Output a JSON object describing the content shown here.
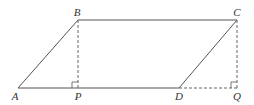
{
  "figure": {
    "type": "parallelogram with perpendiculars",
    "points": {
      "A": {
        "label": "A",
        "x": 18,
        "y": 88,
        "lx": 15,
        "ly": 100
      },
      "B": {
        "label": "B",
        "x": 78,
        "y": 20,
        "lx": 77,
        "ly": 16
      },
      "C": {
        "label": "C",
        "x": 237,
        "y": 20,
        "lx": 237,
        "ly": 16
      },
      "D": {
        "label": "D",
        "x": 179,
        "y": 88,
        "lx": 179,
        "ly": 100
      },
      "P": {
        "label": "P",
        "x": 78,
        "y": 88,
        "lx": 78,
        "ly": 100
      },
      "Q": {
        "label": "Q",
        "x": 237,
        "y": 88,
        "lx": 237,
        "ly": 100
      }
    },
    "solid_segments": [
      [
        "A",
        "B"
      ],
      [
        "B",
        "C"
      ],
      [
        "C",
        "D"
      ],
      [
        "A",
        "D"
      ]
    ],
    "dashed_segments": [
      [
        "B",
        "P"
      ],
      [
        "C",
        "Q"
      ],
      [
        "D",
        "Q"
      ]
    ],
    "right_angles": [
      "P",
      "Q"
    ],
    "colors": {
      "line": "#555555",
      "dashed": "#666666",
      "label": "#333333"
    }
  }
}
